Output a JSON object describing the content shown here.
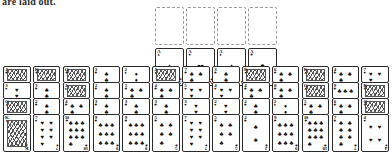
{
  "caption": "are laid out.",
  "game": {
    "name": "freecell-tableau",
    "free_cell_count": 4,
    "foundation_count": 4,
    "tableau_column_count": 12
  },
  "suits": {
    "spade": "♠",
    "heart": "♥",
    "diamond": "♦",
    "club": "♣"
  },
  "free_cells": [
    {
      "name": "free-cell-1",
      "card": null
    },
    {
      "name": "free-cell-2",
      "card": null
    },
    {
      "name": "free-cell-3",
      "card": null
    },
    {
      "name": "free-cell-4",
      "card": null
    }
  ],
  "foundations": [
    {
      "name": "foundation-spades",
      "rank": "A",
      "suit": "spade"
    },
    {
      "name": "foundation-hearts",
      "rank": "A",
      "suit": "heart"
    },
    {
      "name": "foundation-diamonds",
      "rank": "A",
      "suit": "diamond"
    },
    {
      "name": "foundation-clubs",
      "rank": "A",
      "suit": "club"
    }
  ],
  "tableau": [
    {
      "name": "tableau-column-1",
      "cards": [
        {
          "rank": "J",
          "suit": "club",
          "face": true
        },
        {
          "rank": "3",
          "suit": "heart",
          "face": false
        },
        {
          "rank": "Q",
          "suit": "spade",
          "face": true
        },
        {
          "rank": "K",
          "suit": "spade",
          "face": true
        }
      ]
    },
    {
      "name": "tableau-column-2",
      "cards": [
        {
          "rank": "K",
          "suit": "club",
          "face": true
        },
        {
          "rank": "3",
          "suit": "club",
          "face": false
        },
        {
          "rank": "2",
          "suit": "club",
          "face": false
        },
        {
          "rank": "7",
          "suit": "heart",
          "face": false
        }
      ]
    },
    {
      "name": "tableau-column-3",
      "cards": [
        {
          "rank": "Q",
          "suit": "club",
          "face": true
        },
        {
          "rank": "J",
          "suit": "spade",
          "face": true
        },
        {
          "rank": "4",
          "suit": "club",
          "face": false
        },
        {
          "rank": "10",
          "suit": "club",
          "face": false
        }
      ]
    },
    {
      "name": "tableau-column-4",
      "cards": [
        {
          "rank": "3",
          "suit": "club",
          "face": false
        },
        {
          "rank": "2",
          "suit": "club",
          "face": false
        },
        {
          "rank": "3",
          "suit": "club",
          "face": false
        },
        {
          "rank": "9",
          "suit": "club",
          "face": false
        }
      ]
    },
    {
      "name": "tableau-column-5",
      "cards": [
        {
          "rank": "2",
          "suit": "diamond",
          "face": false
        },
        {
          "rank": "5",
          "suit": "club",
          "face": false
        },
        {
          "rank": "3",
          "suit": "club",
          "face": false
        },
        {
          "rank": "9",
          "suit": "club",
          "face": false
        }
      ]
    },
    {
      "name": "tableau-column-6",
      "cards": [
        {
          "rank": "J",
          "suit": "diamond",
          "face": true
        },
        {
          "rank": "4",
          "suit": "club",
          "face": false
        },
        {
          "rank": "3",
          "suit": "club",
          "face": false
        },
        {
          "rank": "5",
          "suit": "club",
          "face": false
        }
      ]
    },
    {
      "name": "tableau-column-7",
      "cards": [
        {
          "rank": "7",
          "suit": "club",
          "face": false
        },
        {
          "rank": "5",
          "suit": "heart",
          "face": false
        },
        {
          "rank": "3",
          "suit": "heart",
          "face": false
        },
        {
          "rank": "7",
          "suit": "heart",
          "face": false
        }
      ]
    },
    {
      "name": "tableau-column-8",
      "cards": [
        {
          "rank": "3",
          "suit": "club",
          "face": false
        },
        {
          "rank": "4",
          "suit": "heart",
          "face": false
        },
        {
          "rank": "2",
          "suit": "heart",
          "face": false
        },
        {
          "rank": "5",
          "suit": "club",
          "face": false
        }
      ]
    },
    {
      "name": "tableau-column-9",
      "cards": [
        {
          "rank": "K",
          "suit": "heart",
          "face": true
        },
        {
          "rank": "4",
          "suit": "club",
          "face": false
        },
        {
          "rank": "2",
          "suit": "club",
          "face": false
        },
        {
          "rank": "2",
          "suit": "club",
          "face": false
        }
      ]
    },
    {
      "name": "tableau-column-10",
      "cards": [
        {
          "rank": "6",
          "suit": "club",
          "face": false
        },
        {
          "rank": "8",
          "suit": "club",
          "face": false
        },
        {
          "rank": "2",
          "suit": "diamond",
          "face": false
        },
        {
          "rank": "9",
          "suit": "club",
          "face": false
        }
      ]
    },
    {
      "name": "tableau-column-11",
      "cards": [
        {
          "rank": "K",
          "suit": "spade",
          "face": true
        },
        {
          "rank": "Q",
          "suit": "spade",
          "face": true
        },
        {
          "rank": "5",
          "suit": "club",
          "face": false
        },
        {
          "rank": "10",
          "suit": "club",
          "face": false
        }
      ]
    },
    {
      "name": "tableau-column-12",
      "cards": [
        {
          "rank": "4",
          "suit": "club",
          "face": false
        },
        {
          "rank": "9",
          "suit": "club",
          "face": false
        },
        {
          "rank": "6",
          "suit": "club",
          "face": false
        },
        {
          "rank": "7",
          "suit": "club",
          "face": false
        }
      ]
    },
    {
      "name": "tableau-column-13",
      "cards": [
        {
          "rank": "7",
          "suit": "heart",
          "face": false
        },
        {
          "rank": "K",
          "suit": "club",
          "face": true
        },
        {
          "rank": "Q",
          "suit": "club",
          "face": true
        },
        {
          "rank": "4",
          "suit": "heart",
          "face": false
        }
      ]
    }
  ],
  "layout": {
    "card_w": 29,
    "card_h": 38,
    "stack_step": 16,
    "free_row_top": 7,
    "foundation_row_top": 48,
    "foundation_left": 155,
    "tableau_top": 66,
    "tableau_left": 3,
    "tableau_gap": 2.3
  }
}
